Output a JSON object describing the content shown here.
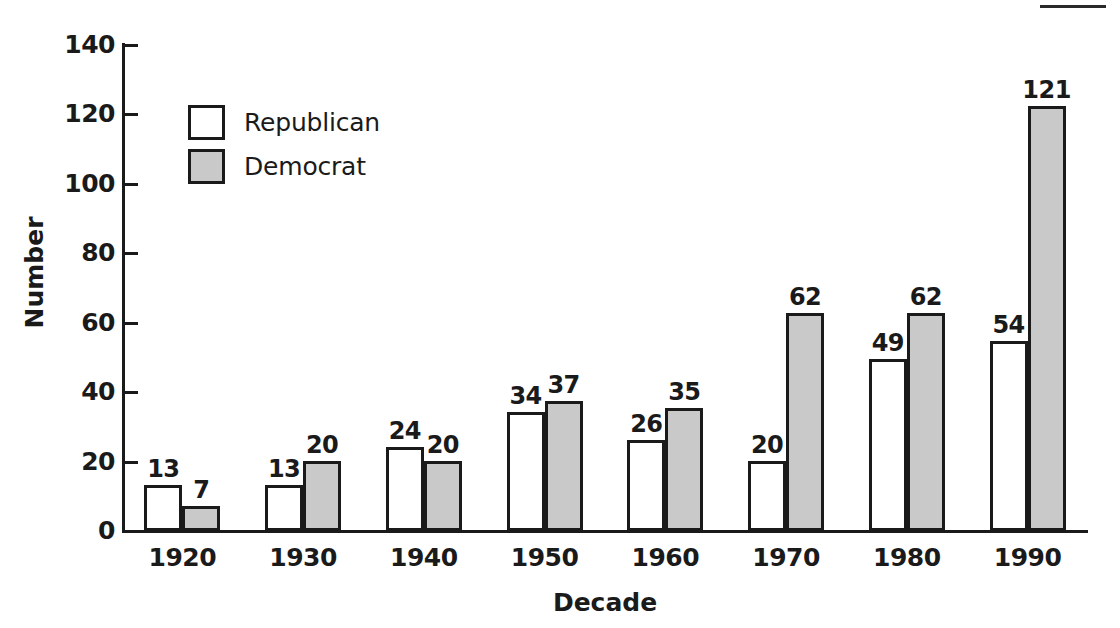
{
  "chart_data": {
    "type": "bar",
    "title": "",
    "xlabel": "Decade",
    "ylabel": "Number",
    "categories": [
      "1920",
      "1930",
      "1940",
      "1950",
      "1960",
      "1970",
      "1980",
      "1990"
    ],
    "series": [
      {
        "name": "Republican",
        "values": [
          13,
          13,
          24,
          34,
          26,
          20,
          49,
          54
        ],
        "color": "#ffffff"
      },
      {
        "name": "Democrat",
        "values": [
          7,
          20,
          20,
          37,
          35,
          62,
          62,
          121
        ],
        "color": "#c9c9c9"
      }
    ],
    "ylim": [
      0,
      140
    ],
    "yticks": [
      0,
      20,
      40,
      60,
      80,
      100,
      120,
      140
    ],
    "grid": false,
    "legend_position": "top-left",
    "legend_entries": [
      "Republican",
      "Democrat"
    ],
    "data_labels": true
  },
  "axes": {
    "y_title": "Number",
    "x_title": "Decade"
  }
}
